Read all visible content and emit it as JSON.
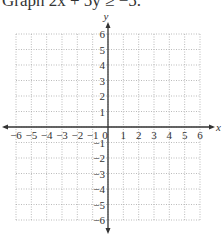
{
  "problem": {
    "prompt": "Graph 2x + 5y ≥ −5."
  },
  "chart_data": {
    "type": "coordinate-grid",
    "title": "Graph 2x + 5y ≥ −5.",
    "xlabel": "x",
    "ylabel": "y",
    "xlim": [
      -6,
      6
    ],
    "ylim": [
      -6,
      6
    ],
    "grid": true,
    "grid_style": "dotted",
    "x_ticks": [
      -6,
      -5,
      -4,
      -3,
      -2,
      -1,
      0,
      1,
      2,
      3,
      4,
      5,
      6
    ],
    "y_ticks": [
      -6,
      -5,
      -4,
      -3,
      -2,
      -1,
      1,
      2,
      3,
      4,
      5,
      6
    ],
    "x_tick_labels": [
      "−6",
      "−5",
      "−4",
      "−3",
      "−2",
      "−1",
      "0",
      "1",
      "2",
      "3",
      "4",
      "5",
      "6"
    ],
    "y_tick_labels": [
      "−6",
      "−5",
      "−4",
      "−3",
      "−2",
      "−1",
      "1",
      "2",
      "3",
      "4",
      "5",
      "6"
    ],
    "series": []
  },
  "colors": {
    "axis": "#333333",
    "grid": "#aaaaaa"
  }
}
